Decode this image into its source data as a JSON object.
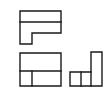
{
  "diagram": {
    "type": "orthographic-projection",
    "background": "#ffffff",
    "line_color": "#1a1a1a",
    "views": [
      {
        "name": "top-view",
        "outline": "20,11 61,11 61,33 32,33 32,44 20,44",
        "lines": [
          [
            20,
            22,
            61,
            22
          ]
        ]
      },
      {
        "name": "front-view",
        "outline": "20,53 61,53 61,86 20,86",
        "lines": [
          [
            20,
            71,
            61,
            71
          ],
          [
            32,
            71,
            32,
            86
          ]
        ]
      },
      {
        "name": "side-view",
        "outline": "91,52 102,52 102,86 70,86 70,72 91,72",
        "lines": [
          [
            81,
            72,
            81,
            86
          ],
          [
            91,
            72,
            91,
            86
          ]
        ]
      }
    ]
  }
}
